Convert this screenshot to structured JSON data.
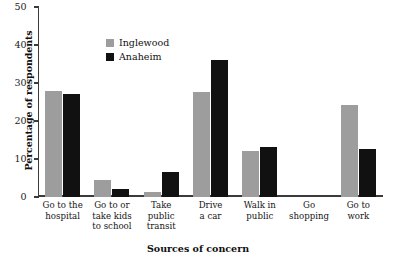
{
  "chart_data": {
    "type": "bar",
    "title": "",
    "xlabel": "Sources of concern",
    "ylabel": "Percentage of respondents",
    "ylim": [
      0,
      50
    ],
    "yticks": [
      0,
      10,
      20,
      30,
      40,
      50
    ],
    "grid": false,
    "legend_position": "top-center",
    "categories": [
      "Go to the\nhospital",
      "Go to or\ntake kids\nto school",
      "Take\npublic\ntransit",
      "Drive\na car",
      "Walk in\npublic",
      "Go\nshopping",
      "Go to\nwork"
    ],
    "category_lines": [
      [
        "Go to the",
        "hospital"
      ],
      [
        "Go to or",
        "take kids",
        "to school"
      ],
      [
        "Take",
        "public",
        "transit"
      ],
      [
        "Drive",
        "a car"
      ],
      [
        "Walk in",
        "public"
      ],
      [
        "Go",
        "shopping"
      ],
      [
        "Go to",
        "work"
      ]
    ],
    "series": [
      {
        "name": "Inglewood",
        "color": "#9d9d9d",
        "values": [
          27.8,
          4.5,
          1.3,
          27.6,
          12.1,
          0,
          24.2
        ]
      },
      {
        "name": "Anaheim",
        "color": "#111111",
        "values": [
          27.1,
          2.1,
          6.6,
          36.0,
          13.2,
          0,
          12.6
        ]
      }
    ]
  },
  "axis": {
    "tick_labels": [
      "0",
      "10",
      "20",
      "30",
      "40",
      "50"
    ]
  },
  "legend": {
    "entries": [
      {
        "label": "Inglewood",
        "swatch": "legend-swatch-inglewood"
      },
      {
        "label": "Anaheim",
        "swatch": "legend-swatch-anaheim"
      }
    ]
  }
}
